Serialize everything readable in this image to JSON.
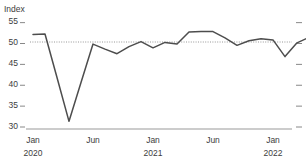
{
  "chart_data": {
    "type": "line",
    "title": "",
    "subtitle": "",
    "ylabel": "Index",
    "xlabel": "",
    "ylim": [
      30,
      56.5
    ],
    "yticks": [
      30,
      35,
      40,
      45,
      50,
      55
    ],
    "ytick_labels": [
      "30",
      "35",
      "40",
      "45",
      "50",
      "55"
    ],
    "grid": false,
    "legend": "none",
    "reference_line": {
      "value": 50,
      "style": "dotted",
      "label": ""
    },
    "x_tick_labels": [
      {
        "month": "Jan",
        "year": "2020"
      },
      {
        "month": "Jun",
        "year": ""
      },
      {
        "month": "Jan",
        "year": "2021"
      },
      {
        "month": "Jun",
        "year": ""
      },
      {
        "month": "Jan",
        "year": "2022"
      }
    ],
    "x": [
      "Jan 2020",
      "Feb 2020",
      "Mar 2020",
      "Apr 2020",
      "May 2020",
      "Jun 2020",
      "Jul 2020",
      "Aug 2020",
      "Sep 2020",
      "Oct 2020",
      "Nov 2020",
      "Dec 2020",
      "Jan 2021",
      "Feb 2021",
      "Mar 2021",
      "Apr 2021",
      "May 2021",
      "Jun 2021",
      "Jul 2021",
      "Aug 2021",
      "Sep 2021",
      "Oct 2021",
      "Nov 2021",
      "Dec 2021",
      "Jan 2022",
      "Feb 2022"
    ],
    "series": [
      {
        "name": "Index",
        "color": "#4d4d4d",
        "values": [
          51.8,
          51.9,
          41.5,
          31.0,
          40.3,
          49.5,
          48.3,
          47.2,
          48.9,
          50.1,
          48.6,
          49.9,
          49.5,
          52.4,
          52.5,
          52.5,
          51.0,
          49.2,
          50.3,
          50.8,
          50.5,
          46.5,
          49.8,
          51.1,
          51.5,
          52.0
        ]
      }
    ]
  }
}
